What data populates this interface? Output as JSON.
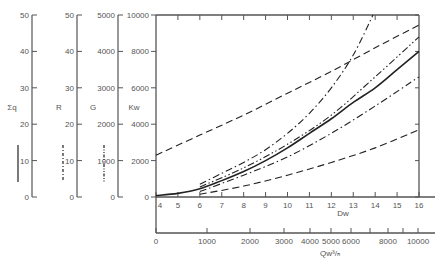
{
  "chart_data": {
    "type": "line",
    "title": "",
    "xlabel": "Dw",
    "ylabel": "Kw",
    "xlim": [
      4,
      16
    ],
    "ylim": [
      0,
      10000
    ],
    "grid": false,
    "x_ticks": [
      4,
      5,
      6,
      7,
      8,
      9,
      10,
      11,
      12,
      13,
      14,
      15,
      16
    ],
    "y_ticks": [
      0,
      2000,
      4000,
      6000,
      8000,
      10000
    ],
    "secondary_x_axis": {
      "label": "Qw³/ₕ",
      "ticks": [
        {
          "label": "0",
          "x_px": 156
        },
        {
          "label": "1000",
          "x_px": 207
        },
        {
          "label": "2000",
          "x_px": 250
        },
        {
          "label": "3000",
          "x_px": 284
        },
        {
          "label": "4000",
          "x_px": 310
        },
        {
          "label": "5000",
          "x_px": 331
        },
        {
          "label": "6000",
          "x_px": 351
        },
        {
          "label": "",
          "x_px": 370
        },
        {
          "label": "8000",
          "x_px": 388
        },
        {
          "label": "",
          "x_px": 403
        },
        {
          "label": "10000",
          "x_px": 418
        }
      ]
    },
    "auxiliary_scales": [
      {
        "name": "Σq",
        "ticks": [
          0,
          10,
          20,
          30,
          40,
          50
        ],
        "line_style": "solid"
      },
      {
        "name": "R",
        "ticks": [
          0,
          10,
          20,
          30,
          40,
          50
        ],
        "line_style": "dash-dot"
      },
      {
        "name": "G",
        "ticks": [
          0,
          1000,
          2000,
          3000,
          4000,
          5000
        ],
        "line_style": "dash-dot-dot"
      },
      {
        "name": "Kw",
        "ticks": [
          0,
          2000,
          4000,
          6000,
          8000,
          10000
        ],
        "line_style": "solid"
      }
    ],
    "series": [
      {
        "name": "Kw (solid)",
        "style": "solid",
        "x": [
          4,
          5,
          6,
          7,
          8,
          9,
          10,
          11,
          12,
          13,
          14,
          15,
          16
        ],
        "values": [
          80,
          200,
          450,
          900,
          1400,
          2000,
          2700,
          3500,
          4300,
          5200,
          6000,
          7000,
          8000
        ]
      },
      {
        "name": "upper dashed",
        "style": "dashed",
        "x": [
          4,
          6,
          8,
          10,
          12,
          14,
          16
        ],
        "values": [
          2300,
          3400,
          4500,
          5700,
          6900,
          8200,
          9450
        ]
      },
      {
        "name": "lower dashed",
        "style": "dashed",
        "x": [
          6,
          8,
          10,
          12,
          14,
          16
        ],
        "values": [
          150,
          600,
          1200,
          1900,
          2700,
          3700
        ]
      },
      {
        "name": "steep dash-dot",
        "style": "dash-dot",
        "x": [
          6,
          7,
          8,
          9,
          10,
          11,
          12,
          13,
          13.9
        ],
        "values": [
          700,
          1300,
          1900,
          2600,
          3500,
          4600,
          6000,
          7800,
          10000
        ]
      },
      {
        "name": "upper dash-dot-dot",
        "style": "dash-dot-dot",
        "x": [
          6,
          8,
          10,
          12,
          14,
          16
        ],
        "values": [
          550,
          1600,
          2900,
          4500,
          6600,
          8800
        ]
      },
      {
        "name": "lower dash-dot",
        "style": "dash-dot",
        "x": [
          6,
          8,
          10,
          12,
          14,
          16
        ],
        "values": [
          300,
          1200,
          2200,
          3500,
          5000,
          6600
        ]
      }
    ]
  },
  "labels": {
    "sigma_q": "Σq",
    "r": "R",
    "g": "G",
    "kw": "Kw",
    "dw": "Dw",
    "qw": "Qw³/ₕ"
  }
}
